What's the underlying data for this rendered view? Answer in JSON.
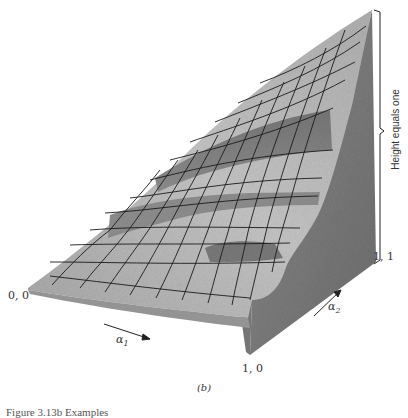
{
  "figure": {
    "panel_label": "(b)",
    "caption_partial": "Figure 3.13b  Examples",
    "axes": {
      "alpha1_label": "α",
      "alpha1_sub": "1",
      "alpha2_label": "α",
      "alpha2_sub": "2",
      "height_label": "Height equals one"
    },
    "corners": {
      "origin": "0, 0",
      "x_end": "1, 0",
      "xy_end": "1, 1"
    },
    "colors": {
      "surface_light": "#c9c9c9",
      "surface_mid": "#9e9e9e",
      "surface_dark": "#6f6f6f",
      "wall": "#7d7d7d",
      "grid": "#1a1a1a",
      "text": "#333333"
    }
  }
}
